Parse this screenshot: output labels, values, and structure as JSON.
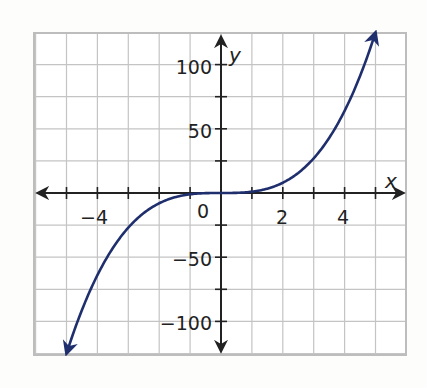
{
  "chart_data": {
    "type": "line",
    "title": "",
    "xlabel": "x",
    "ylabel": "y",
    "xlim": [
      -5.5,
      6.5
    ],
    "ylim": [
      -125,
      125
    ],
    "x_ticks_labeled": [
      -4,
      0,
      2,
      4
    ],
    "x_tick_labels": [
      "−4",
      "0",
      "2",
      "4"
    ],
    "y_ticks_labeled": [
      100,
      50,
      -50,
      -100
    ],
    "y_tick_labels": [
      "100",
      "50",
      "−50",
      "−100"
    ],
    "grid": true,
    "grid_x_step": 1,
    "grid_y_step": 25,
    "series": [
      {
        "name": "y = x^3",
        "color": "#1f2f6e",
        "x": [
          -5,
          -4.5,
          -4,
          -3.5,
          -3,
          -2.5,
          -2,
          -1.5,
          -1,
          -0.5,
          0,
          0.5,
          1,
          1.5,
          2,
          2.5,
          3,
          3.5,
          4,
          4.5,
          5
        ],
        "values": [
          -125,
          -91.1,
          -64,
          -42.9,
          -27,
          -15.6,
          -8,
          -3.4,
          -1,
          -0.1,
          0,
          0.1,
          1,
          3.4,
          8,
          15.6,
          27,
          42.9,
          64,
          91.1,
          125
        ],
        "arrows_both_ends": true
      }
    ]
  },
  "labels": {
    "x_axis": "x",
    "y_axis": "y",
    "origin": "0",
    "xm4": "−4",
    "x2": "2",
    "x4": "4",
    "y100": "100",
    "y50": "50",
    "ym50": "−50",
    "ym100": "−100"
  }
}
